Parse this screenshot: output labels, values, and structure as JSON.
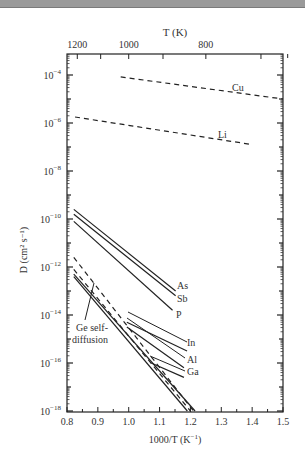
{
  "chart_data": {
    "type": "line",
    "title": "",
    "xlabel": "1000/T (K⁻¹)",
    "ylabel": "D (cm² s⁻¹)",
    "top_xlabel": "T (K)",
    "xlim": [
      0.8,
      1.5
    ],
    "ylim_log10": [
      -18,
      -3.1
    ],
    "yscale": "log",
    "grid": false,
    "x_ticks": [
      "0.8",
      "0.9",
      "1.0",
      "1.1",
      "1.2",
      "1.3",
      "1.4",
      "1.5"
    ],
    "y_ticks": [
      {
        "exp": "-4",
        "value": 0.0001
      },
      {
        "exp": "-6",
        "value": 1e-06
      },
      {
        "exp": "-8",
        "value": 1e-08
      },
      {
        "exp": "-10",
        "value": 1e-10
      },
      {
        "exp": "-12",
        "value": 1e-12
      },
      {
        "exp": "-14",
        "value": 1e-14
      },
      {
        "exp": "-16",
        "value": 1e-16
      },
      {
        "exp": "-18",
        "value": 1e-18
      }
    ],
    "top_x_ticks": [
      {
        "label": "1200",
        "x": 0.833
      },
      {
        "label": "1000",
        "x": 1.0
      },
      {
        "label": "800",
        "x": 1.25
      }
    ],
    "series": [
      {
        "name": "Cu",
        "style": "dashed",
        "x": [
          0.974,
          1.5
        ],
        "log10_D": [
          -4.08,
          -5.0
        ]
      },
      {
        "name": "Li",
        "style": "dashed",
        "x": [
          0.826,
          1.4
        ],
        "log10_D": [
          -5.75,
          -6.9
        ]
      },
      {
        "name": "As",
        "style": "solid",
        "x": [
          0.822,
          1.152
        ],
        "log10_D": [
          -9.6,
          -13.0
        ]
      },
      {
        "name": "Sb",
        "style": "solid",
        "x": [
          0.822,
          1.152
        ],
        "log10_D": [
          -9.8,
          -13.2
        ]
      },
      {
        "name": "P",
        "style": "solid",
        "x": [
          0.822,
          1.142
        ],
        "log10_D": [
          -10.1,
          -13.8
        ]
      },
      {
        "name": "In",
        "style": "solid",
        "x": [
          0.994,
          1.189
        ],
        "log10_D": [
          -14.3,
          -15.5
        ]
      },
      {
        "name": "Al",
        "style": "solid",
        "x": [
          0.994,
          1.179
        ],
        "log10_D": [
          -14.5,
          -16.2
        ]
      },
      {
        "name": "Ga",
        "style": "solid",
        "x": [
          1.073,
          1.179
        ],
        "log10_D": [
          -16.0,
          -16.6
        ]
      },
      {
        "name": "dopant-dashed-1",
        "style": "dashed",
        "x": [
          0.822,
          1.21
        ],
        "log10_D": [
          -11.6,
          -18.0
        ]
      },
      {
        "name": "dopant-dashed-2",
        "style": "dashed",
        "x": [
          0.822,
          1.2
        ],
        "log10_D": [
          -12.1,
          -18.0
        ]
      },
      {
        "name": "Ge self-diffusion",
        "style": "solid",
        "x": [
          0.822,
          1.19
        ],
        "log10_D": [
          -12.4,
          -18.0
        ]
      },
      {
        "name": "Ge self-diffusion (2)",
        "style": "solid",
        "x": [
          0.822,
          1.215
        ],
        "log10_D": [
          -12.3,
          -18.0
        ]
      }
    ],
    "annotations": [
      "Cu",
      "Li",
      "As",
      "Sb",
      "P",
      "In",
      "Al",
      "Ga",
      "Ge self-",
      "diffusion"
    ]
  },
  "labels": {
    "top_axis_title": "T (K)",
    "x_axis_title_main": "1000/T (K",
    "x_axis_title_sup": "−1",
    "x_axis_title_end": ")",
    "y_axis_title": "D (cm² s⁻¹)",
    "ytick_base": "10",
    "cu": "Cu",
    "li": "Li",
    "as": "As",
    "sb": "Sb",
    "p": "P",
    "in": "In",
    "al": "Al",
    "ga": "Ga",
    "ge_line1": "Ge self-",
    "ge_line2": "diffusion"
  }
}
